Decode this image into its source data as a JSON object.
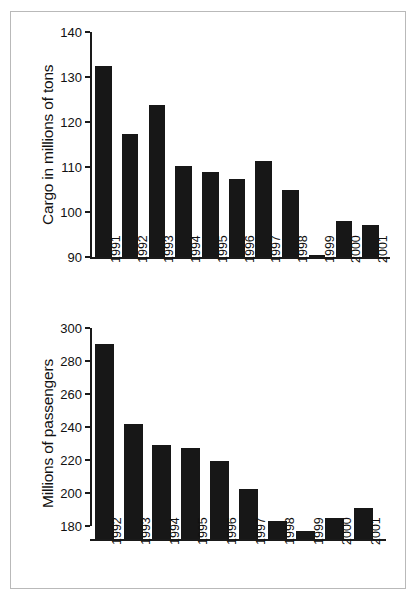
{
  "figure": {
    "background_color": "#ffffff",
    "border_color": "#b9b9b9",
    "bar_color": "#171717",
    "axis_color": "#1a1a1a"
  },
  "chart_data": [
    {
      "type": "bar",
      "id": "cargo",
      "title": "",
      "xlabel": "",
      "ylabel": "Cargo in millions of tons",
      "ylim": [
        90,
        140
      ],
      "yticks": [
        90,
        100,
        110,
        120,
        130,
        140
      ],
      "ytick_labels": [
        "90",
        "100",
        "110",
        "120",
        "130",
        "140"
      ],
      "grid": false,
      "legend": "none",
      "categories": [
        "1991",
        "1992",
        "1993",
        "1994",
        "1995",
        "1996",
        "1997",
        "1998",
        "1999",
        "2000",
        "2001"
      ],
      "values": [
        132.5,
        117.3,
        123.7,
        110.3,
        109.0,
        107.3,
        111.4,
        104.9,
        90.5,
        98.1,
        97.2
      ]
    },
    {
      "type": "bar",
      "id": "passengers",
      "title": "",
      "xlabel": "",
      "ylabel": "Millions of passengers",
      "ylim": [
        172,
        300
      ],
      "yticks": [
        180,
        200,
        220,
        240,
        260,
        280,
        300
      ],
      "ytick_labels": [
        "180",
        "200",
        "220",
        "240",
        "260",
        "280",
        "300"
      ],
      "grid": false,
      "legend": "none",
      "categories": [
        "1992",
        "1993",
        "1994",
        "1995",
        "1996",
        "1997",
        "1998",
        "1999",
        "2000",
        "2001"
      ],
      "values": [
        290,
        242,
        229,
        227,
        219.5,
        202.5,
        183,
        177,
        185,
        191
      ]
    }
  ]
}
